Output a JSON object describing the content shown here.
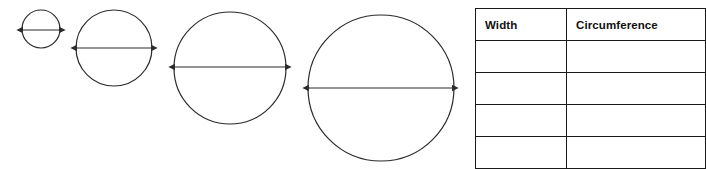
{
  "worksheet": {
    "title": "Circle width and circumference worksheet",
    "background_color": "#ffffff",
    "stroke_color": "#2b2b2b",
    "table_border_color": "#1a1a1a",
    "text_color": "#111111"
  },
  "figures": {
    "label": "Circles with diameter arrows",
    "count": 4,
    "items": [
      {
        "name": "circle-1",
        "order": "1",
        "cx": 41,
        "cy": 29,
        "r": 19,
        "arrow_y": 30,
        "arrow_x1": 23,
        "arrow_x2": 59,
        "size_label": "smallest"
      },
      {
        "name": "circle-2",
        "order": "2",
        "cx": 114,
        "cy": 48,
        "r": 38,
        "arrow_y": 48,
        "arrow_x1": 77,
        "arrow_x2": 151,
        "size_label": "small"
      },
      {
        "name": "circle-3",
        "order": "3",
        "cx": 230,
        "cy": 68,
        "r": 56,
        "arrow_y": 67,
        "arrow_x1": 175,
        "arrow_x2": 285,
        "size_label": "medium"
      },
      {
        "name": "circle-4",
        "order": "4",
        "cx": 381,
        "cy": 88,
        "r": 73,
        "arrow_y": 88,
        "arrow_x1": 309,
        "arrow_x2": 452,
        "size_label": "large"
      }
    ]
  },
  "table": {
    "name": "width-circumference-table",
    "headers": {
      "width": "Width",
      "circumference": "Circumference"
    },
    "columns": [
      "Width",
      "Circumference"
    ],
    "row_count": 4,
    "rows": [
      {
        "width": "",
        "circumference": ""
      },
      {
        "width": "",
        "circumference": ""
      },
      {
        "width": "",
        "circumference": ""
      },
      {
        "width": "",
        "circumference": ""
      }
    ]
  }
}
